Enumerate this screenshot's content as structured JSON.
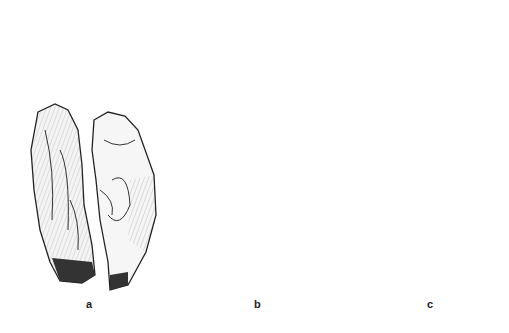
{
  "figure": {
    "background": "#ffffff",
    "ink_color": "#222222",
    "groups": [
      {
        "label": "a",
        "label_x": 86,
        "label_y": 298,
        "description": "stone tool, two views"
      },
      {
        "label": "b",
        "label_x": 254,
        "label_y": 298,
        "description": "elongated stone tool, two views"
      },
      {
        "label": "c",
        "label_x": 427,
        "label_y": 298,
        "description": "stone tool with reconstructed outline and cross-section, two views"
      }
    ]
  }
}
